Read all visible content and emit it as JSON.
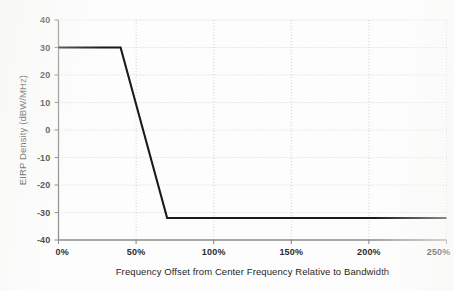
{
  "chart_data": {
    "type": "line",
    "title": "",
    "subtitle": "",
    "xlabel": "Frequency Offset from Center Frequency Relative to Bandwidth",
    "ylabel": "EIRP Density (dBW/MHz)",
    "xlim": [
      0,
      250
    ],
    "ylim": [
      -40,
      40
    ],
    "xtick_labels": [
      "0%",
      "50%",
      "100%",
      "150%",
      "200%",
      "250%"
    ],
    "xticks": [
      0,
      50,
      100,
      150,
      200,
      250
    ],
    "ytick_labels": [
      "40",
      "30",
      "20",
      "10",
      "0",
      "-10",
      "-20",
      "-30",
      "-40"
    ],
    "yticks": [
      40,
      30,
      20,
      10,
      0,
      -10,
      -20,
      -30,
      -40
    ],
    "grid": true,
    "legend": false,
    "legend_position": "none",
    "line_color": "#1a1a1a",
    "series": [
      {
        "name": "EIRP density mask",
        "x": [
          0,
          40,
          70,
          250
        ],
        "y": [
          30,
          30,
          -32,
          -32
        ]
      }
    ],
    "annotations": []
  },
  "axes": {
    "x_title": "Frequency Offset from Center Frequency Relative to Bandwidth",
    "y_title": "EIRP Density (dBW/MHz)"
  },
  "ticks": {
    "y": [
      {
        "label": "40",
        "value": 40
      },
      {
        "label": "30",
        "value": 30
      },
      {
        "label": "20",
        "value": 20
      },
      {
        "label": "10",
        "value": 10
      },
      {
        "label": "0",
        "value": 0
      },
      {
        "label": "-10",
        "value": -10
      },
      {
        "label": "-20",
        "value": -20
      },
      {
        "label": "-30",
        "value": -30
      },
      {
        "label": "-40",
        "value": -40
      }
    ],
    "x": [
      {
        "label": "0%",
        "value": 0
      },
      {
        "label": "50%",
        "value": 50
      },
      {
        "label": "100%",
        "value": 100
      },
      {
        "label": "150%",
        "value": 150
      },
      {
        "label": "200%",
        "value": 200
      },
      {
        "label": "250%",
        "value": 250
      }
    ]
  }
}
